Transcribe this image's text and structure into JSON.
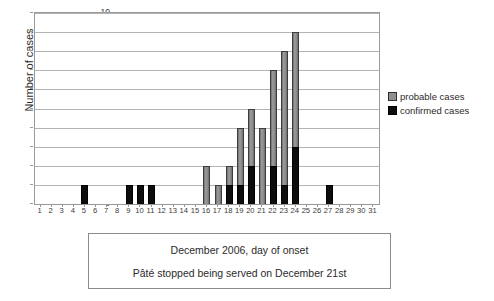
{
  "chart_data": {
    "type": "bar",
    "title": "",
    "xlabel": "December 2006, day of onset",
    "ylabel": "Number of cases",
    "xlim": [
      1,
      31
    ],
    "ylim": [
      0,
      10
    ],
    "ytick_step": 1,
    "grid": true,
    "stacked": true,
    "legend_position": "right",
    "categories": [
      1,
      2,
      3,
      4,
      5,
      6,
      7,
      8,
      9,
      10,
      11,
      12,
      13,
      14,
      15,
      16,
      17,
      18,
      19,
      20,
      21,
      22,
      23,
      24,
      25,
      26,
      27,
      28,
      29,
      30,
      31
    ],
    "series": [
      {
        "name": "confirmed cases",
        "color": "#0d0d0d",
        "values": [
          0,
          0,
          0,
          0,
          1,
          0,
          0,
          0,
          1,
          1,
          1,
          0,
          0,
          0,
          0,
          0,
          0,
          1,
          1,
          2,
          0,
          2,
          1,
          3,
          0,
          0,
          1,
          0,
          0,
          0,
          0
        ]
      },
      {
        "name": "probable cases",
        "color": "#8f8f8f",
        "values": [
          0,
          0,
          0,
          0,
          0,
          0,
          0,
          0,
          0,
          0,
          0,
          0,
          0,
          0,
          0,
          2,
          1,
          1,
          3,
          3,
          4,
          5,
          7,
          6,
          0,
          0,
          0,
          0,
          0,
          0,
          0
        ]
      }
    ],
    "totals": [
      0,
      0,
      0,
      0,
      1,
      0,
      0,
      0,
      1,
      1,
      1,
      0,
      0,
      0,
      0,
      2,
      1,
      2,
      4,
      5,
      4,
      7,
      8,
      9,
      0,
      0,
      1,
      0,
      0,
      0,
      0
    ],
    "ytick_labels": [
      "0",
      "1",
      "2",
      "3",
      "4",
      "5",
      "6",
      "7",
      "8",
      "9",
      "10"
    ],
    "xtick_labels": [
      "1",
      "2",
      "3",
      "4",
      "5",
      "6",
      "7",
      "8",
      "9",
      "10",
      "11",
      "12",
      "13",
      "14",
      "15",
      "16",
      "17",
      "18",
      "19",
      "20",
      "21",
      "22",
      "23",
      "24",
      "25",
      "26",
      "27",
      "28",
      "29",
      "30",
      "31"
    ]
  },
  "legend": {
    "items": [
      {
        "label": "probable cases",
        "color": "#8f8f8f"
      },
      {
        "label": "confirmed cases",
        "color": "#0d0d0d"
      }
    ]
  },
  "caption": {
    "line1": "December 2006, day of onset",
    "line2": "Pâté stopped being served on December 21st"
  }
}
